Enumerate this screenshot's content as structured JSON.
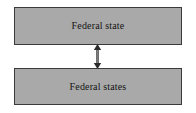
{
  "diagram": {
    "background_color": "#ffffff",
    "node_fill_color": "#a9a9a9",
    "node_border_color": "#3a3a3a",
    "connector_color": "#2b2b2b",
    "nodes": [
      {
        "id": "federal-state",
        "label": "Federal state",
        "position": "top"
      },
      {
        "id": "federal-states",
        "label": "Federal states",
        "position": "bottom"
      }
    ],
    "connectors": [
      {
        "id": "bidirectional-link",
        "type": "double-headed-arrow",
        "orientation": "vertical",
        "from": "federal-state",
        "to": "federal-states",
        "label": ""
      }
    ]
  }
}
